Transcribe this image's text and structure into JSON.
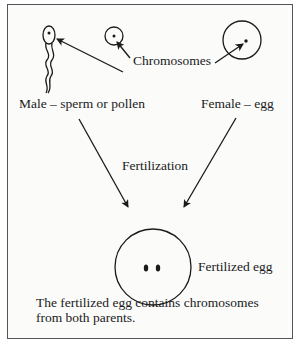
{
  "diagram": {
    "labels": {
      "chromosomes": "Chromosomes",
      "male": "Male – sperm or pollen",
      "female": "Female – egg",
      "fertilization": "Fertilization",
      "fertilized_egg": "Fertilized egg"
    },
    "caption": {
      "line1": "The fertilized egg contains chromosomes",
      "line2": "from both parents."
    },
    "nodes": [
      {
        "id": "sperm",
        "shape": "tadpole",
        "label": "Male – sperm or pollen"
      },
      {
        "id": "pollen",
        "shape": "small-circle"
      },
      {
        "id": "egg",
        "shape": "large-circle",
        "label": "Female – egg"
      },
      {
        "id": "zygote",
        "shape": "circle-with-two-dots",
        "label": "Fertilized egg"
      }
    ],
    "edges": [
      {
        "from": "chromosomes-label",
        "to": "sperm",
        "note": "points to nucleus"
      },
      {
        "from": "chromosomes-label",
        "to": "pollen",
        "note": "points to nucleus"
      },
      {
        "from": "chromosomes-label",
        "to": "egg",
        "note": "points to nucleus"
      },
      {
        "from": "sperm",
        "to": "zygote",
        "label": "Fertilization"
      },
      {
        "from": "egg",
        "to": "zygote",
        "label": "Fertilization"
      }
    ],
    "colors": {
      "stroke": "#1a1a1a",
      "background": "#fbfbfa",
      "border": "#555555"
    }
  }
}
